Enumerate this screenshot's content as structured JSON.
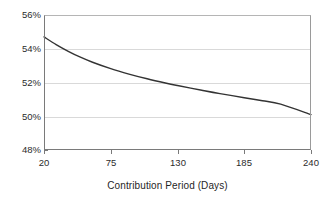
{
  "chart_data": {
    "type": "line",
    "title": "",
    "subtitle": "",
    "xlabel": "Contribution Period (Days)",
    "ylabel": "",
    "xlim": [
      20,
      240
    ],
    "ylim": [
      48,
      56
    ],
    "xticks": [
      "20",
      "75",
      "130",
      "185",
      "240"
    ],
    "xtick_values": [
      20,
      75,
      130,
      185,
      240
    ],
    "yticks": [
      "48%",
      "50%",
      "52%",
      "54%",
      "56%"
    ],
    "ytick_values": [
      48,
      50,
      52,
      54,
      56
    ],
    "grid": "horizontal",
    "legend": "none",
    "annotations": [],
    "series": [
      {
        "name": "contribution-rate",
        "color": "#333333",
        "x": [
          20,
          30,
          40,
          50,
          60,
          75,
          90,
          105,
          120,
          130,
          150,
          165,
          185,
          200,
          215,
          240
        ],
        "values": [
          54.7,
          54.25,
          53.85,
          53.5,
          53.2,
          52.82,
          52.5,
          52.22,
          51.97,
          51.82,
          51.54,
          51.34,
          51.1,
          50.92,
          50.72,
          50.1
        ]
      }
    ]
  },
  "axis": {
    "x_title": "Contribution Period (Days)",
    "x_tick_labels": [
      "20",
      "75",
      "130",
      "185",
      "240"
    ],
    "y_tick_labels": [
      "56%",
      "54%",
      "52%",
      "50%",
      "48%"
    ]
  },
  "colors": {
    "series_line": "#333333",
    "gridline": "#d9d9d9",
    "axis": "#7a7a7a",
    "background": "#ffffff",
    "text": "#1f1f1f"
  }
}
